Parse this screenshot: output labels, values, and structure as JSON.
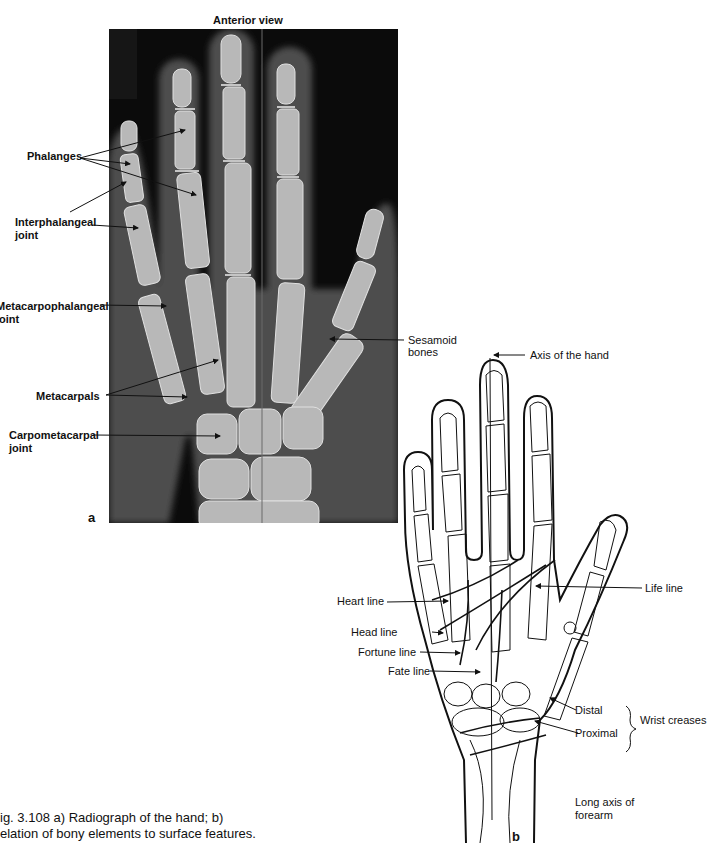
{
  "figure": {
    "panel_a": {
      "title": "Anterior view",
      "letter": "a",
      "labels": {
        "phalanges": "Phalanges",
        "interphalangeal_1": "Interphalangeal",
        "interphalangeal_2": "joint",
        "metacarpophalangeal_1": "Metacarpophalangeal",
        "metacarpophalangeal_2": "joint",
        "metacarpals": "Metacarpals",
        "carpometacarpal_1": "Carpometacarpal",
        "carpometacarpal_2": "joint",
        "sesamoid_1": "Sesamoid",
        "sesamoid_2": "bones"
      }
    },
    "panel_b": {
      "letter": "b",
      "labels": {
        "axis_of_hand": "Axis of the hand",
        "life_line": "Life line",
        "heart_line": "Heart line",
        "head_line": "Head line",
        "fortune_line": "Fortune line",
        "fate_line": "Fate line",
        "distal": "Distal",
        "proximal": "Proximal",
        "wrist_creases": "Wrist creases",
        "long_axis_1": "Long axis of",
        "long_axis_2": "forearm"
      }
    },
    "caption": {
      "line1": "ig. 3.108  a) Radiograph of the hand; b)",
      "line2": "elation of bony elements to surface features."
    }
  }
}
